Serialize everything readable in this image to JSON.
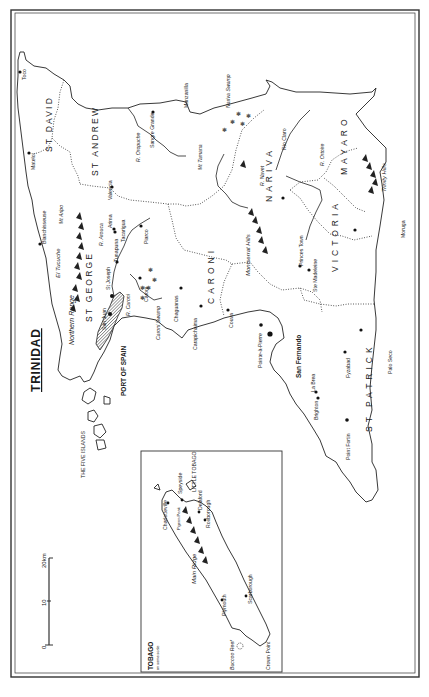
{
  "title": "TRINIDAD",
  "regions": {
    "st_david": "ST DAVID",
    "st_andrew": "ST ANDREW",
    "st_george": "ST GEORGE",
    "caroni": "CARONI",
    "nariva": "NARIVA",
    "mayaro": "MAYARO",
    "victoria": "VICTORIA",
    "st_patrick": "ST PATRICK"
  },
  "towns": {
    "toco": "Toco",
    "matelot": "Matelot",
    "blanchisseuse": "Blanchisseuse",
    "manzanilla": "Manzanilla",
    "sangre_grande": "Sangre Grande",
    "valencia": "Valencia",
    "arima": "Arima",
    "tacarigua": "Tacarigua",
    "tunapuna": "Tunapuna",
    "st_joseph": "St Joseph",
    "san_juan": "San Juan",
    "piarco": "Piarco",
    "caroni": "Caroni",
    "chaguanas": "Chaguanas",
    "carapichaima": "Carapichaima",
    "couva": "Couva",
    "port_of_spain": "PORT OF SPAIN",
    "pointe_a_pierre": "Pointe-à-Pierre",
    "san_fernando": "San Fernando",
    "la_brea": "La Brea",
    "brighton": "Brighton",
    "point_fortin": "Point Fortin",
    "fyzabad": "Fyzabad",
    "palo_seco": "Palo Seco",
    "princes_town": "Princes Town",
    "ste_madeleine": "Ste Madeleine",
    "moruga": "Moruga",
    "rio_claro": "Rio Claro",
    "five_islands": "THE FIVE ISLANDS"
  },
  "features": {
    "mt_aripo": "Mt Aripo",
    "el_tucuche": "El Tucuche",
    "northern_range": "Northern Range",
    "mt_tamana": "Mt Tamana",
    "montserrat_hills": "Montserrat Hills",
    "trinity_hills": "Trinity Hills",
    "nariva_swamp": "Nariva Swamp",
    "caroni_swamp": "Caroni Swamp",
    "r_oropuche": "R. Oropuche",
    "r_arouca": "R. Arouca",
    "r_caroni": "R. Caroni",
    "r_navet": "R. Navet",
    "r_ortoire": "R. Ortoire"
  },
  "scale": {
    "unit_label": "20km",
    "ticks": [
      "0",
      "10",
      "20km"
    ]
  },
  "inset": {
    "title": "TOBAGO",
    "subtitle": "on same scale",
    "labels": {
      "little_tobago": "LITTLE TOBAGO",
      "speyside": "Speyside",
      "charlotteville": "Charlotteville",
      "pigeon_peak": "Pigeon Peak",
      "delaford": "Delaford",
      "roxborough": "Roxborough",
      "main_ridge": "Main Ridge",
      "plymouth": "Plymouth",
      "scarborough": "Scarborough",
      "buccoo_reef": "Buccoo Reef",
      "crown_point": "Crown Point"
    }
  },
  "colors": {
    "ink": "#1a1a1a",
    "paper": "#ffffff",
    "port_of_spain_hatch": "#6a6a6a"
  }
}
